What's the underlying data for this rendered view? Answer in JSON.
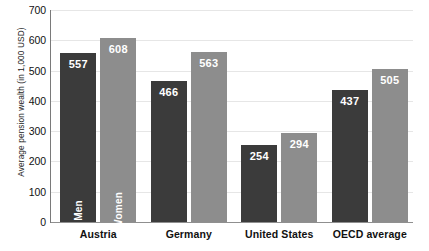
{
  "chart_data": {
    "type": "bar",
    "title": "",
    "subtitle": "",
    "xlabel": "",
    "ylabel": "Average pension wealth (in 1,000 USD)",
    "categories": [
      "Austria",
      "Germany",
      "United States",
      "OECD average"
    ],
    "series": [
      {
        "name": "Men",
        "color": "#3b3b3b",
        "values": [
          557,
          466,
          254,
          437
        ]
      },
      {
        "name": "Women",
        "color": "#8d8d8d",
        "values": [
          608,
          563,
          294,
          505
        ]
      }
    ],
    "ylim": [
      0,
      700
    ],
    "yticks": [
      0,
      100,
      200,
      300,
      400,
      500,
      600,
      700
    ],
    "ytick_labels": [
      "0",
      "100",
      "200",
      "300",
      "400",
      "500",
      "600",
      "700"
    ],
    "grid": true,
    "grid_axis": "y",
    "legend": "in-bar",
    "legend_position": "inside-first-group",
    "data_labels": true,
    "annotations": [
      "Men",
      "Women"
    ],
    "background": "#ffffff",
    "grid_color": "#e6e6e6",
    "axis_color": "#7a7a7a",
    "value_label_color": "#ffffff"
  }
}
